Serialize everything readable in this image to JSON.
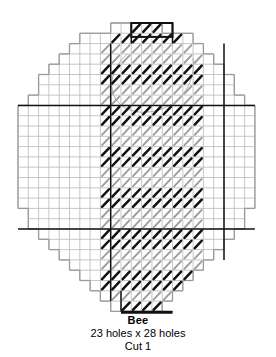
{
  "pattern": {
    "name": "Bee",
    "title_label": "Bee",
    "size_label": "23 holes x 28 holes",
    "cut_label": "Cut 1",
    "holes_wide": 23,
    "holes_tall": 28,
    "cut_count": 1,
    "type": "plastic-canvas-stitch-chart",
    "colors": {
      "grid_line": "#b9b9b9",
      "outline": "#9a9a9a",
      "heavy_line": "#111111",
      "stitch_black": "#111111",
      "stitch_gray": "#9d9d9d",
      "background": "#ffffff",
      "text": "#000000"
    },
    "geometry": {
      "origin_x": 18,
      "origin_y": 23,
      "cell": 10.3,
      "heavy_rows": [
        8,
        20
      ],
      "heavy_cols": [
        9,
        20
      ]
    },
    "shape_rows": [
      {
        "row": 0,
        "start": 9,
        "end": 14
      },
      {
        "row": 1,
        "start": 6,
        "end": 17
      },
      {
        "row": 2,
        "start": 5,
        "end": 18
      },
      {
        "row": 3,
        "start": 4,
        "end": 19
      },
      {
        "row": 4,
        "start": 3,
        "end": 20
      },
      {
        "row": 5,
        "start": 2,
        "end": 21
      },
      {
        "row": 6,
        "start": 2,
        "end": 21
      },
      {
        "row": 7,
        "start": 1,
        "end": 22
      },
      {
        "row": 8,
        "start": 0,
        "end": 23
      },
      {
        "row": 9,
        "start": 0,
        "end": 23
      },
      {
        "row": 10,
        "start": 0,
        "end": 23
      },
      {
        "row": 11,
        "start": 0,
        "end": 23
      },
      {
        "row": 12,
        "start": 0,
        "end": 23
      },
      {
        "row": 13,
        "start": 0,
        "end": 23
      },
      {
        "row": 14,
        "start": 0,
        "end": 23
      },
      {
        "row": 15,
        "start": 0,
        "end": 23
      },
      {
        "row": 16,
        "start": 0,
        "end": 23
      },
      {
        "row": 17,
        "start": 0,
        "end": 23
      },
      {
        "row": 18,
        "start": 1,
        "end": 22
      },
      {
        "row": 19,
        "start": 1,
        "end": 22
      },
      {
        "row": 20,
        "start": 2,
        "end": 21
      },
      {
        "row": 21,
        "start": 3,
        "end": 20
      },
      {
        "row": 22,
        "start": 4,
        "end": 19
      },
      {
        "row": 23,
        "start": 5,
        "end": 18
      },
      {
        "row": 24,
        "start": 6,
        "end": 17
      },
      {
        "row": 25,
        "start": 7,
        "end": 16
      },
      {
        "row": 26,
        "start": 8,
        "end": 15
      },
      {
        "row": 27,
        "start": 9,
        "end": 14
      }
    ],
    "stitch_rows": [
      {
        "row": 0,
        "start": 11,
        "end": 14,
        "color": "black"
      },
      {
        "row": 1,
        "start": 9,
        "end": 16,
        "color": "black"
      },
      {
        "row": 2,
        "start": 8,
        "end": 17,
        "color": "gray"
      },
      {
        "row": 3,
        "start": 8,
        "end": 18,
        "color": "gray"
      },
      {
        "row": 4,
        "start": 8,
        "end": 18,
        "color": "black"
      },
      {
        "row": 5,
        "start": 8,
        "end": 18,
        "color": "black"
      },
      {
        "row": 6,
        "start": 8,
        "end": 18,
        "color": "gray"
      },
      {
        "row": 7,
        "start": 8,
        "end": 18,
        "color": "gray"
      },
      {
        "row": 8,
        "start": 8,
        "end": 18,
        "color": "black"
      },
      {
        "row": 9,
        "start": 8,
        "end": 18,
        "color": "black"
      },
      {
        "row": 10,
        "start": 8,
        "end": 18,
        "color": "gray"
      },
      {
        "row": 11,
        "start": 8,
        "end": 18,
        "color": "gray"
      },
      {
        "row": 12,
        "start": 8,
        "end": 18,
        "color": "black"
      },
      {
        "row": 13,
        "start": 8,
        "end": 18,
        "color": "black"
      },
      {
        "row": 14,
        "start": 8,
        "end": 18,
        "color": "gray"
      },
      {
        "row": 15,
        "start": 8,
        "end": 18,
        "color": "gray"
      },
      {
        "row": 16,
        "start": 8,
        "end": 18,
        "color": "black"
      },
      {
        "row": 17,
        "start": 8,
        "end": 18,
        "color": "black"
      },
      {
        "row": 18,
        "start": 8,
        "end": 18,
        "color": "gray"
      },
      {
        "row": 19,
        "start": 8,
        "end": 18,
        "color": "gray"
      },
      {
        "row": 20,
        "start": 8,
        "end": 18,
        "color": "black"
      },
      {
        "row": 21,
        "start": 8,
        "end": 18,
        "color": "black"
      },
      {
        "row": 22,
        "start": 8,
        "end": 18,
        "color": "gray"
      },
      {
        "row": 23,
        "start": 8,
        "end": 18,
        "color": "gray"
      },
      {
        "row": 24,
        "start": 8,
        "end": 17,
        "color": "black"
      },
      {
        "row": 25,
        "start": 8,
        "end": 17,
        "color": "black"
      },
      {
        "row": 26,
        "start": 9,
        "end": 16,
        "color": "gray"
      },
      {
        "row": 27,
        "start": 10,
        "end": 15,
        "color": "black"
      }
    ],
    "heavy_segments": [
      {
        "type": "horizontal",
        "row": 8,
        "start": 0,
        "end": 23
      },
      {
        "type": "horizontal",
        "row": 20,
        "start": 0,
        "end": 23
      },
      {
        "type": "horizontal",
        "row": 0,
        "start": 11,
        "end": 15
      },
      {
        "type": "horizontal",
        "row": 28,
        "start": 10,
        "end": 15
      },
      {
        "type": "vertical",
        "col": 11,
        "start": 0,
        "end": 2
      },
      {
        "type": "vertical",
        "col": 15,
        "start": 0,
        "end": 2
      },
      {
        "type": "vertical",
        "col": 10,
        "start": 26,
        "end": 28
      },
      {
        "type": "vertical",
        "col": 20,
        "start": 2,
        "end": 23
      },
      {
        "type": "vertical",
        "col": 9,
        "start": 2,
        "end": 27
      }
    ],
    "wing_outline": {
      "description": "faint curved wing arc over upper body",
      "visible": true
    }
  }
}
